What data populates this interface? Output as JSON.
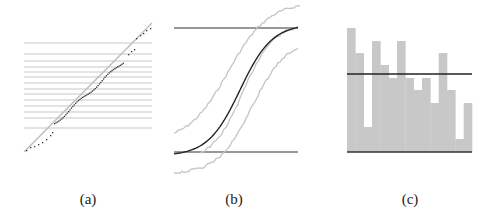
{
  "figure": {
    "panels": [
      {
        "id": "a",
        "caption": "(a)",
        "description": "Quantile-quantile style plot with diagonal reference line, horizontal grid lines and dotted sample curve"
      },
      {
        "id": "b",
        "caption": "(b)",
        "description": "Sigmoid CDF curve between two horizontal bounds with upper and lower gray confidence envelopes"
      },
      {
        "id": "c",
        "caption": "(c)",
        "description": "Gray bar histogram with a horizontal black mean line and baseline"
      }
    ]
  },
  "chart_data": [
    {
      "type": "scatter",
      "panel": "a",
      "title": "(a)",
      "xlabel": "",
      "ylabel": "",
      "grid": "horizontal lines",
      "reference_line": "y = x diagonal",
      "horizontal_lines_count": 14
    },
    {
      "type": "line",
      "panel": "b",
      "title": "(b)",
      "xlabel": "",
      "ylabel": "",
      "series": [
        {
          "name": "cdf",
          "color": "#222222"
        },
        {
          "name": "upper_band",
          "color": "#bbbbbb"
        },
        {
          "name": "lower_band",
          "color": "#bbbbbb"
        }
      ],
      "bounds": [
        "lower",
        "upper"
      ]
    },
    {
      "type": "bar",
      "panel": "c",
      "title": "(c)",
      "xlabel": "",
      "ylabel": "",
      "categories": [
        "1",
        "2",
        "3",
        "4",
        "5",
        "6",
        "7",
        "8",
        "9",
        "10",
        "11",
        "12",
        "13",
        "14",
        "15"
      ],
      "values": [
        124,
        99,
        25,
        111,
        87,
        74,
        111,
        74,
        62,
        74,
        49,
        99,
        62,
        13,
        49
      ],
      "mean_line": 78,
      "ylim": [
        0,
        130
      ],
      "bar_color": "#c8c8c8"
    }
  ]
}
